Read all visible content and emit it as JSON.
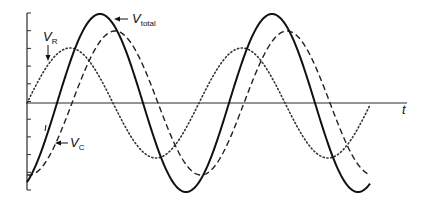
{
  "diagram": {
    "title": "",
    "axis": {
      "x_label": "t",
      "origin": [
        27,
        103
      ],
      "x_end": 407,
      "y_top": 13,
      "y_bottom": 190,
      "tick_count": 11
    },
    "labels": {
      "v_total": {
        "main": "V",
        "sub": "total"
      },
      "v_r": {
        "main": "V",
        "sub": "R"
      },
      "v_c": {
        "main": "V",
        "sub": "C"
      }
    }
  },
  "chart_data": {
    "type": "line",
    "title": "",
    "xlabel": "t",
    "ylabel": "",
    "grid": false,
    "legend": "inline labels with arrows",
    "x_range_px": [
      27,
      370
    ],
    "period_px": 172,
    "series": [
      {
        "name": "V_total",
        "style": "solid",
        "amplitude": 89,
        "zero_cross_up_px": 57
      },
      {
        "name": "V_C",
        "style": "dashed",
        "amplitude": 72,
        "zero_cross_up_px": 72
      },
      {
        "name": "V_R",
        "style": "dotted",
        "amplitude": 55,
        "zero_cross_up_px": 27
      }
    ]
  }
}
